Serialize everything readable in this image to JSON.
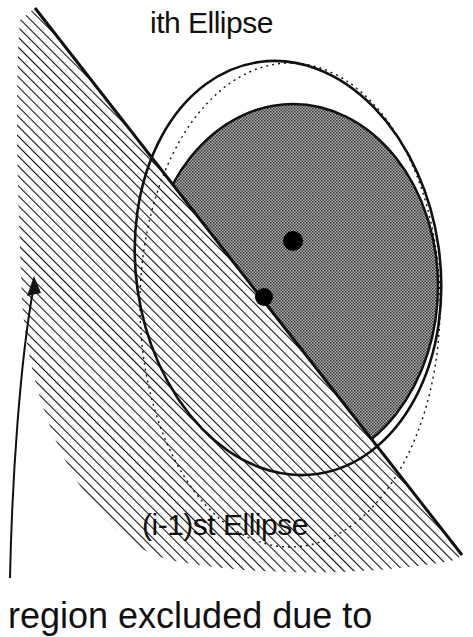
{
  "figure": {
    "labels": {
      "ith_ellipse": "ith Ellipse",
      "prev_ellipse": "(i-1)st Ellipse",
      "region_caption": "region excluded due to"
    },
    "elements": {
      "cutting_line": {
        "x1": 35,
        "y1": 8,
        "x2": 462,
        "y2": 555
      },
      "ith_ellipse": {
        "cx": 288,
        "cy": 268,
        "rx": 152,
        "ry": 208,
        "rotate": -8
      },
      "prev_ellipse_dotted": {
        "cx": 283,
        "cy": 300,
        "rx": 160,
        "ry": 250
      },
      "feasible_region_shaded": {
        "cx": 293,
        "cy": 286,
        "rx": 145,
        "ry": 182
      },
      "center_points": [
        {
          "name": "new-center",
          "cx": 293,
          "cy": 241,
          "r": 10
        },
        {
          "name": "old-center",
          "cx": 264,
          "cy": 297,
          "r": 9
        }
      ],
      "arrow": {
        "from": [
          10,
          578
        ],
        "to": [
          36,
          278
        ]
      }
    },
    "colors": {
      "ink": "#111111",
      "shade": "#8c8c8c",
      "background": "#ffffff"
    }
  }
}
